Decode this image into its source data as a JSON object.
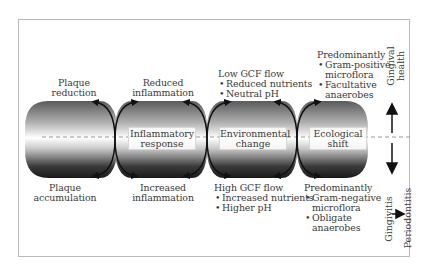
{
  "diagram": {
    "stages": [
      {
        "id": "plaque",
        "top_label": [
          "Plaque",
          "reduction"
        ],
        "bottom_label": [
          "Plaque",
          "accumulation"
        ]
      },
      {
        "id": "inflammatory",
        "box_label": [
          "Inflammatory",
          "response"
        ],
        "top_label": [
          "Reduced",
          "inflammation"
        ],
        "bottom_label": [
          "Increased",
          "inflammation"
        ]
      },
      {
        "id": "environmental",
        "box_label": [
          "Environmental",
          "change"
        ],
        "top_heading": "Low GCF flow",
        "top_bullets": [
          "Reduced nutrients",
          "Neutral pH"
        ],
        "bottom_heading": "High GCF flow",
        "bottom_bullets": [
          "Increased nutrients",
          "Higher pH"
        ]
      },
      {
        "id": "ecological",
        "box_label": [
          "Ecological",
          "shift"
        ],
        "top_heading": "Predominantly",
        "top_bullets": [
          [
            "Gram-positive",
            "microflora"
          ],
          [
            "Facultative",
            "anaerobes"
          ]
        ],
        "bottom_heading": "Predominantly",
        "bottom_bullets": [
          [
            "Gram-negative",
            "microflora"
          ],
          [
            "Obligate",
            "anaerobes"
          ]
        ]
      }
    ],
    "axis": {
      "up_label": [
        "Gingival",
        "health"
      ],
      "down_label_1": "Gingivitis",
      "down_label_2": "Periodontitis"
    },
    "icons": {
      "cycle_arrow": "curved-arrow-icon",
      "up_arrow": "arrow-up-icon",
      "down_arrow": "arrow-down-icon",
      "right_arrow": "arrow-right-icon"
    },
    "colors": {
      "frame": "#b8b8b8",
      "shape_dark": "#1e1e1e",
      "shape_light": "#ffffff",
      "arrow": "#111111",
      "dashed_line": "#9a9a9a",
      "text": "#3a3a3a"
    }
  }
}
